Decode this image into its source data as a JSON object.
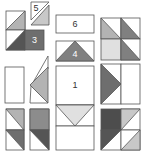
{
  "diagram": {
    "title": "",
    "type": "quilt block piece layout",
    "colors": {
      "white": "#ffffff",
      "light": "#d9d9d9",
      "medium": "#a6a6a6",
      "dark": "#6e6e6e",
      "darker": "#4d4d4d",
      "stroke": "#555555"
    },
    "labels": {
      "piece1": "1",
      "piece3": "3",
      "piece4": "4",
      "piece5": "5",
      "piece6": "6"
    }
  }
}
